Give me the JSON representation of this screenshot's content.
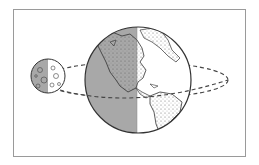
{
  "diagram": {
    "title": "Earth and Moon orbit illustration",
    "elements": {
      "earth": {
        "label": "Earth",
        "shaded_side": "left",
        "visible_continents": [
          "North America",
          "South America",
          "Greenland"
        ]
      },
      "moon": {
        "label": "Moon",
        "shaded_side": "left"
      },
      "orbit": {
        "label": "Moon orbit",
        "style": "dashed ellipse"
      }
    },
    "colors": {
      "shadow": "#a8a8a8",
      "outline": "#333333",
      "land_lit": "#ffffff",
      "frame": "#9a9a9a"
    }
  }
}
